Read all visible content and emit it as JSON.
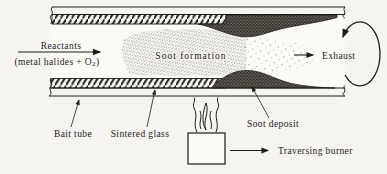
{
  "figure": {
    "title_semantic": "soot-deposition-tube-diagram",
    "background": "#f6f4f0",
    "ink": "#1c1c1c",
    "paper": "#fbfaf7",
    "labels": {
      "reactants": "Reactants",
      "reactants_formula_pre": "(metal halides + O",
      "reactants_formula_sub": "2",
      "reactants_formula_post": ")",
      "soot_formation": "Soot formation",
      "exhaust": "Exhaust",
      "bait_tube": "Bait tube",
      "sintered_glass": "Sintered glass",
      "soot_deposit": "Soot deposit",
      "traversing_burner": "Traversing burner"
    },
    "icons": {
      "rotation": "rotation-arrow-icon",
      "flame": "flame-icon",
      "arrows": "flow-arrow-icon"
    }
  }
}
